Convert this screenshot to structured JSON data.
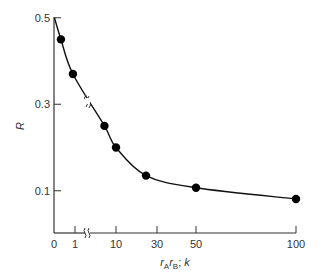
{
  "chart_data": {
    "type": "line",
    "title": "",
    "xlabel": "r_A r_B; k",
    "ylabel": "R",
    "x_axis_broken": true,
    "y_curve_broken": true,
    "grid": false,
    "legend": null,
    "x_ticks": [
      {
        "value": 0,
        "label": "0",
        "px": 54
      },
      {
        "value": 1,
        "label": "1",
        "px": 75
      },
      {
        "value": 10,
        "label": "10",
        "px": 116
      },
      {
        "value": 30,
        "label": "30",
        "px": 157
      },
      {
        "value": 50,
        "label": "50",
        "px": 196
      },
      {
        "value": 100,
        "label": "100",
        "px": 296
      }
    ],
    "y_ticks": [
      {
        "value": 0.5,
        "label": "0.5"
      },
      {
        "value": 0.3,
        "label": "0.3"
      },
      {
        "value": 0.1,
        "label": "0.1"
      }
    ],
    "ylim": [
      0,
      0.5
    ],
    "series": [
      {
        "name": "R",
        "marker": "filled-circle",
        "points": [
          {
            "x": 0.33,
            "y": 0.45
          },
          {
            "x": 0.9,
            "y": 0.37
          },
          {
            "x": 6,
            "y": 0.25
          },
          {
            "x": 10,
            "y": 0.2
          },
          {
            "x": 25,
            "y": 0.135
          },
          {
            "x": 50,
            "y": 0.107
          },
          {
            "x": 100,
            "y": 0.081
          }
        ]
      }
    ],
    "colors": {
      "line": "#111111",
      "marker": "#000000",
      "axis": "#333333"
    }
  },
  "labels": {
    "y_axis": "R",
    "x_axis_r": "r",
    "x_axis_sub_a": "A",
    "x_axis_sub_b": "B",
    "x_axis_tail": "; ",
    "x_axis_k": "k"
  }
}
